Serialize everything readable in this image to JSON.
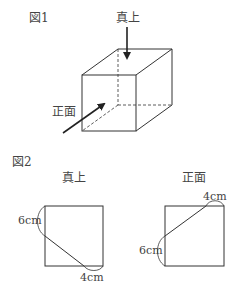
{
  "figure1": {
    "title": "図1",
    "label_top": "真上",
    "label_front": "正面"
  },
  "figure2": {
    "title": "図2",
    "top_view": {
      "label": "真上",
      "dim_left": "6cm",
      "dim_bottom": "4cm"
    },
    "front_view": {
      "label": "正面",
      "dim_top": "4cm",
      "dim_left": "6cm"
    }
  }
}
